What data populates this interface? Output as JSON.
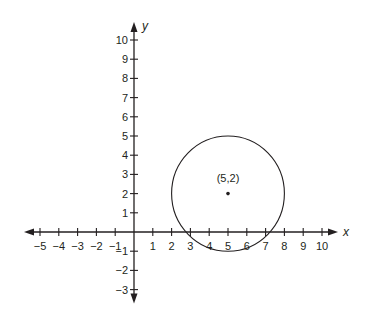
{
  "chart_data": {
    "type": "scatter",
    "title": "",
    "xlabel": "x",
    "ylabel": "y",
    "xlim": [
      -5,
      10
    ],
    "ylim": [
      -3,
      10
    ],
    "grid": false,
    "x_ticks": [
      -5,
      -4,
      -3,
      -2,
      -1,
      1,
      2,
      3,
      4,
      5,
      6,
      7,
      8,
      9,
      10
    ],
    "x_tick_labels": [
      "−5",
      "−4",
      "−3",
      "−2",
      "−1",
      "1",
      "2",
      "3",
      "4",
      "5",
      "6",
      "7",
      "8",
      "9",
      "10"
    ],
    "y_ticks": [
      -3,
      -2,
      -1,
      1,
      2,
      3,
      4,
      5,
      6,
      7,
      8,
      9,
      10
    ],
    "y_tick_labels": [
      "−3",
      "−2",
      "−1",
      "1",
      "2",
      "3",
      "4",
      "5",
      "6",
      "7",
      "8",
      "9",
      "10"
    ],
    "shapes": [
      {
        "kind": "circle",
        "center": [
          5,
          2
        ],
        "radius": 3
      }
    ],
    "points": [
      {
        "x": 5,
        "y": 2,
        "label": "(5,2)"
      }
    ],
    "colors": {
      "ink": "#231f20",
      "background": "#ffffff"
    }
  }
}
